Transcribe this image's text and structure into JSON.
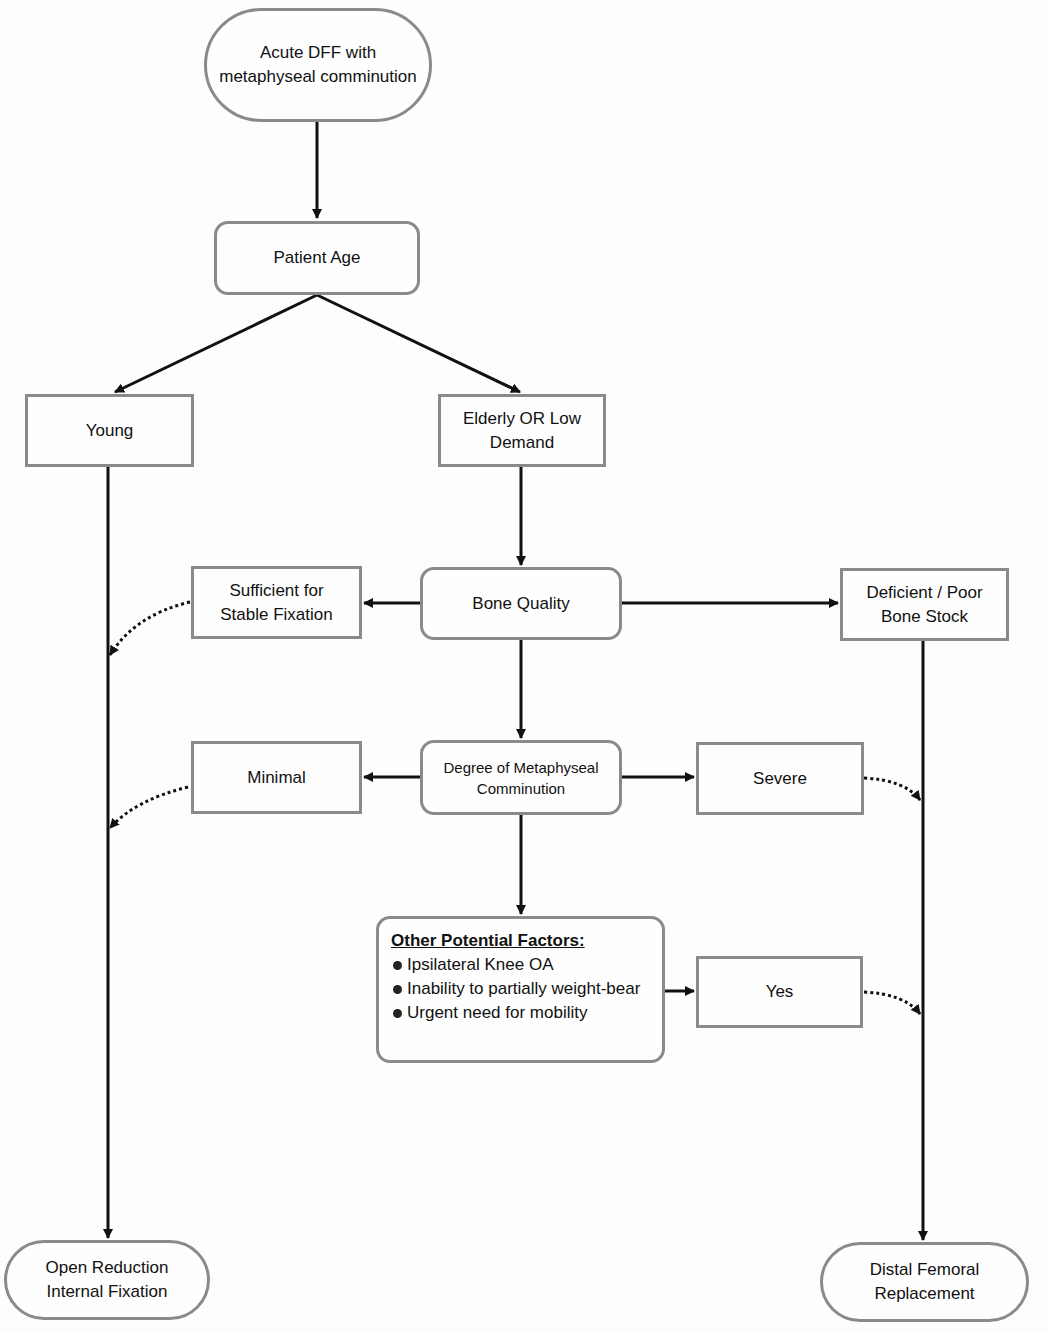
{
  "nodes": {
    "start": "Acute DFF with metaphyseal comminution",
    "age": "Patient Age",
    "young": "Young",
    "elderly": "Elderly OR Low Demand",
    "bone_quality": "Bone Quality",
    "sufficient": "Sufficient for Stable Fixation",
    "deficient": "Deficient / Poor Bone Stock",
    "comminution": "Degree of Metaphyseal Comminution",
    "minimal": "Minimal",
    "severe": "Severe",
    "yes": "Yes",
    "orif": "Open Reduction Internal Fixation",
    "dfr": "Distal Femoral Replacement"
  },
  "factors": {
    "title": "Other Potential Factors:",
    "items": [
      "Ipsilateral Knee OA",
      "Inability to partially weight-bear",
      "Urgent need for mobility"
    ]
  },
  "colors": {
    "border": "#8a8a8a",
    "line": "#111111"
  }
}
